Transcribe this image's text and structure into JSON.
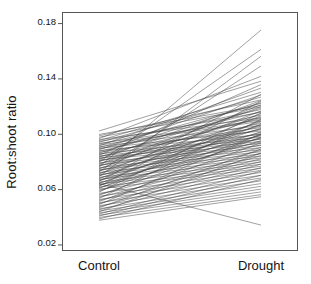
{
  "chart_data": {
    "type": "line",
    "subtype": "slopegraph",
    "title": "",
    "xlabel": "",
    "ylabel": "Root:shoot ratio",
    "categories": [
      "Control",
      "Drought"
    ],
    "x": [
      0,
      1
    ],
    "ylim": [
      0.016,
      0.188
    ],
    "yticks": [
      0.02,
      0.06,
      0.1,
      0.14,
      0.18
    ],
    "ytick_labels": [
      "0.02",
      "0.06",
      "0.10",
      "0.14",
      "0.18"
    ],
    "xtick_labels": [
      "Control",
      "Drought"
    ],
    "grid": false,
    "legend": false,
    "legend_position": "none",
    "line_color": "#1a1a1a",
    "line_width": 0.5,
    "axis_color": "#555555",
    "background_color": "#ffffff",
    "n_series": 104,
    "annotations": [],
    "series": [
      {
        "name": "s1",
        "values": [
          0.102,
          0.138
        ]
      },
      {
        "name": "s2",
        "values": [
          0.0995,
          0.1205
        ]
      },
      {
        "name": "s3",
        "values": [
          0.0985,
          0.1245
        ]
      },
      {
        "name": "s4",
        "values": [
          0.0975,
          0.1195
        ]
      },
      {
        "name": "s5",
        "values": [
          0.0965,
          0.1415
        ]
      },
      {
        "name": "s6",
        "values": [
          0.0958,
          0.1115
        ]
      },
      {
        "name": "s7",
        "values": [
          0.095,
          0.13
        ]
      },
      {
        "name": "s8",
        "values": [
          0.0944,
          0.1155
        ]
      },
      {
        "name": "s9",
        "values": [
          0.0938,
          0.1265
        ]
      },
      {
        "name": "s10",
        "values": [
          0.093,
          0.11
        ]
      },
      {
        "name": "s11",
        "values": [
          0.0925,
          0.1175
        ]
      },
      {
        "name": "s12",
        "values": [
          0.0918,
          0.109
        ]
      },
      {
        "name": "s13",
        "values": [
          0.0912,
          0.133
        ]
      },
      {
        "name": "s14",
        "values": [
          0.0906,
          0.106
        ]
      },
      {
        "name": "s15",
        "values": [
          0.09,
          0.122
        ]
      },
      {
        "name": "s16",
        "values": [
          0.0895,
          0.102
        ]
      },
      {
        "name": "s17",
        "values": [
          0.089,
          0.1135
        ]
      },
      {
        "name": "s18",
        "values": [
          0.0884,
          0.128
        ]
      },
      {
        "name": "s19",
        "values": [
          0.0878,
          0.0995
        ]
      },
      {
        "name": "s20",
        "values": [
          0.0872,
          0.116
        ]
      },
      {
        "name": "s21",
        "values": [
          0.0866,
          0.1045
        ]
      },
      {
        "name": "s22",
        "values": [
          0.086,
          0.1225
        ]
      },
      {
        "name": "s23",
        "values": [
          0.0855,
          0.0975
        ]
      },
      {
        "name": "s24",
        "values": [
          0.085,
          0.111
        ]
      },
      {
        "name": "s25",
        "values": [
          0.0845,
          0.1355
        ]
      },
      {
        "name": "s26",
        "values": [
          0.084,
          0.096
        ]
      },
      {
        "name": "s27",
        "values": [
          0.0835,
          0.1075
        ]
      },
      {
        "name": "s28",
        "values": [
          0.083,
          0.1185
        ]
      },
      {
        "name": "s29",
        "values": [
          0.0825,
          0.0945
        ]
      },
      {
        "name": "s30",
        "values": [
          0.082,
          0.103
        ]
      },
      {
        "name": "s31",
        "values": [
          0.0815,
          0.124
        ]
      },
      {
        "name": "s32",
        "values": [
          0.081,
          0.093
        ]
      },
      {
        "name": "s33",
        "values": [
          0.0805,
          0.1
        ]
      },
      {
        "name": "s34",
        "values": [
          0.08,
          0.112
        ]
      },
      {
        "name": "s35",
        "values": [
          0.0795,
          0.161
        ]
      },
      {
        "name": "s36",
        "values": [
          0.079,
          0.0915
        ]
      },
      {
        "name": "s37",
        "values": [
          0.0785,
          0.1055
        ]
      },
      {
        "name": "s38",
        "values": [
          0.078,
          0.1195
        ]
      },
      {
        "name": "s39",
        "values": [
          0.0775,
          0.09
        ]
      },
      {
        "name": "s40",
        "values": [
          0.077,
          0.0985
        ]
      },
      {
        "name": "s41",
        "values": [
          0.0765,
          0.1145
        ]
      },
      {
        "name": "s42",
        "values": [
          0.076,
          0.175
        ]
      },
      {
        "name": "s43",
        "values": [
          0.0755,
          0.0885
        ]
      },
      {
        "name": "s44",
        "values": [
          0.075,
          0.1035
        ]
      },
      {
        "name": "s45",
        "values": [
          0.0745,
          0.121
        ]
      },
      {
        "name": "s46",
        "values": [
          0.074,
          0.087
        ]
      },
      {
        "name": "s47",
        "values": [
          0.0735,
          0.0965
        ]
      },
      {
        "name": "s48",
        "values": [
          0.073,
          0.1085
        ]
      },
      {
        "name": "s49",
        "values": [
          0.0725,
          0.149
        ]
      },
      {
        "name": "s50",
        "values": [
          0.072,
          0.0855
        ]
      },
      {
        "name": "s51",
        "values": [
          0.0715,
          0.101
        ]
      },
      {
        "name": "s52",
        "values": [
          0.071,
          0.1165
        ]
      },
      {
        "name": "s53",
        "values": [
          0.0705,
          0.084
        ]
      },
      {
        "name": "s54",
        "values": [
          0.07,
          0.094
        ]
      },
      {
        "name": "s55",
        "values": [
          0.0695,
          0.1065
        ]
      },
      {
        "name": "s56",
        "values": [
          0.069,
          0.156
        ]
      },
      {
        "name": "s57",
        "values": [
          0.0685,
          0.0825
        ]
      },
      {
        "name": "s58",
        "values": [
          0.068,
          0.099
        ]
      },
      {
        "name": "s59",
        "values": [
          0.0675,
          0.113
        ]
      },
      {
        "name": "s60",
        "values": [
          0.067,
          0.081
        ]
      },
      {
        "name": "s61",
        "values": [
          0.0665,
          0.092
        ]
      },
      {
        "name": "s62",
        "values": [
          0.066,
          0.104
        ]
      },
      {
        "name": "s63",
        "values": [
          0.0655,
          0.1285
        ]
      },
      {
        "name": "s64",
        "values": [
          0.065,
          0.0795
        ]
      },
      {
        "name": "s65",
        "values": [
          0.0645,
          0.097
        ]
      },
      {
        "name": "s66",
        "values": [
          0.064,
          0.1095
        ]
      },
      {
        "name": "s67",
        "values": [
          0.0635,
          0.078
        ]
      },
      {
        "name": "s68",
        "values": [
          0.063,
          0.09
        ]
      },
      {
        "name": "s69",
        "values": [
          0.0625,
          0.1015
        ]
      },
      {
        "name": "s70",
        "values": [
          0.062,
          0.1235
        ]
      },
      {
        "name": "s71",
        "values": [
          0.0615,
          0.0765
        ]
      },
      {
        "name": "s72",
        "values": [
          0.061,
          0.095
        ]
      },
      {
        "name": "s73",
        "values": [
          0.0605,
          0.107
        ]
      },
      {
        "name": "s74",
        "values": [
          0.06,
          0.075
        ]
      },
      {
        "name": "s75",
        "values": [
          0.0592,
          0.088
        ]
      },
      {
        "name": "s76",
        "values": [
          0.0585,
          0.0995
        ]
      },
      {
        "name": "s77",
        "values": [
          0.0578,
          0.115
        ]
      },
      {
        "name": "s78",
        "values": [
          0.057,
          0.0735
        ]
      },
      {
        "name": "s79",
        "values": [
          0.0562,
          0.086
        ]
      },
      {
        "name": "s80",
        "values": [
          0.0555,
          0.0975
        ]
      },
      {
        "name": "s81",
        "values": [
          0.0548,
          0.072
        ]
      },
      {
        "name": "s82",
        "values": [
          0.054,
          0.084
        ]
      },
      {
        "name": "s83",
        "values": [
          0.0532,
          0.1105
        ]
      },
      {
        "name": "s84",
        "values": [
          0.0525,
          0.07
        ]
      },
      {
        "name": "s85",
        "values": [
          0.0518,
          0.082
        ]
      },
      {
        "name": "s86",
        "values": [
          0.051,
          0.0935
        ]
      },
      {
        "name": "s87",
        "values": [
          0.0502,
          0.068
        ]
      },
      {
        "name": "s88",
        "values": [
          0.0495,
          0.08
        ]
      },
      {
        "name": "s89",
        "values": [
          0.0488,
          0.1
        ]
      },
      {
        "name": "s90",
        "values": [
          0.048,
          0.066
        ]
      },
      {
        "name": "s91",
        "values": [
          0.0472,
          0.078
        ]
      },
      {
        "name": "s92",
        "values": [
          0.0465,
          0.089
        ]
      },
      {
        "name": "s93",
        "values": [
          0.0458,
          0.064
        ]
      },
      {
        "name": "s94",
        "values": [
          0.045,
          0.0755
        ]
      },
      {
        "name": "s95",
        "values": [
          0.0442,
          0.062
        ]
      },
      {
        "name": "s96",
        "values": [
          0.0435,
          0.086
        ]
      },
      {
        "name": "s97",
        "values": [
          0.0428,
          0.06
        ]
      },
      {
        "name": "s98",
        "values": [
          0.042,
          0.073
        ]
      },
      {
        "name": "s99",
        "values": [
          0.0412,
          0.058
        ]
      },
      {
        "name": "s100",
        "values": [
          0.0405,
          0.07
        ]
      },
      {
        "name": "s101",
        "values": [
          0.0395,
          0.056
        ]
      },
      {
        "name": "s102",
        "values": [
          0.0385,
          0.067
        ]
      },
      {
        "name": "s103",
        "values": [
          0.0375,
          0.0545
        ]
      },
      {
        "name": "s104",
        "values": [
          0.064,
          0.034
        ]
      }
    ]
  }
}
